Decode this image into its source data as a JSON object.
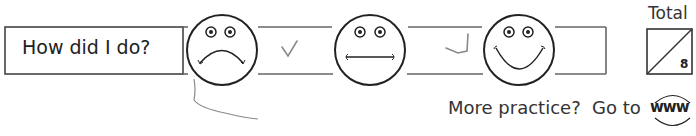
{
  "worksheet_footer": {
    "self_assessment": {
      "prompt": "How did I do?",
      "faces": [
        {
          "name": "sad-face",
          "mood": "sad"
        },
        {
          "name": "neutral-face",
          "mood": "neutral"
        },
        {
          "name": "happy-face",
          "mood": "happy"
        }
      ],
      "checkmarks": [
        "✓",
        "✓"
      ]
    },
    "score": {
      "label": "Total",
      "max": "8",
      "value": ""
    },
    "more_practice": {
      "text": "More practice?  Go to",
      "link_label": "www"
    },
    "colors": {
      "ink": "#2a2a2a",
      "pencil": "#8a8a8a",
      "line": "#555555"
    }
  }
}
